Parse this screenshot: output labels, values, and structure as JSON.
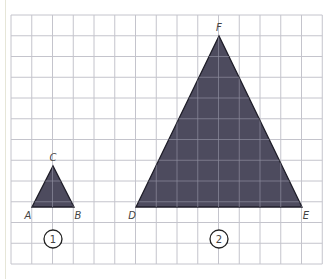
{
  "grid": {
    "x0": 11,
    "y0": 15,
    "cols": 15,
    "rows": 12,
    "cell": 20.75,
    "line_color": "#c4c4cc",
    "inner_line_color": "#8e8e9e"
  },
  "fill_color": "#4d4b5e",
  "triangles": [
    {
      "id": "1",
      "label": "1",
      "vertices": [
        {
          "name": "A",
          "x": 32,
          "y": 207
        },
        {
          "name": "B",
          "x": 74,
          "y": 207
        },
        {
          "name": "C",
          "x": 53,
          "y": 166
        }
      ],
      "badge": {
        "x": 53,
        "y": 239
      }
    },
    {
      "id": "2",
      "label": "2",
      "vertices": [
        {
          "name": "D",
          "x": 136,
          "y": 207
        },
        {
          "name": "E",
          "x": 302,
          "y": 207
        },
        {
          "name": "F",
          "x": 219,
          "y": 36
        }
      ],
      "badge": {
        "x": 219,
        "y": 239
      }
    }
  ],
  "labels": {
    "A": "A",
    "B": "B",
    "C": "C",
    "D": "D",
    "E": "E",
    "F": "F",
    "t1": "1",
    "t2": "2"
  }
}
